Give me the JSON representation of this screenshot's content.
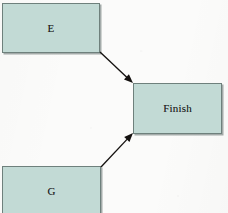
{
  "diagram": {
    "type": "flowchart",
    "title": "",
    "canvas": {
      "width": 228,
      "height": 213,
      "background": "#fbfbfa"
    },
    "style": {
      "node_fill": "#c2dad5",
      "node_border": "#6e807c",
      "node_shadow": "#5c6a67",
      "edge_color": "#14110f",
      "label_color": "#1d1d1d"
    },
    "nodes": [
      {
        "id": "E",
        "label": "E",
        "shape": "rectangle",
        "x": 2,
        "y": 3,
        "width": 98,
        "height": 50,
        "cropped": false
      },
      {
        "id": "Finish",
        "label": "Finish",
        "shape": "rectangle",
        "x": 133,
        "y": 83,
        "width": 89,
        "height": 51,
        "cropped": false
      },
      {
        "id": "G",
        "label": "G",
        "shape": "rectangle",
        "x": 2,
        "y": 166,
        "width": 99,
        "height": 56,
        "cropped": true
      }
    ],
    "edges": [
      {
        "id": "edge-e-finish",
        "from": "E",
        "to": "Finish",
        "label": "",
        "arrowhead": "filled-triangle",
        "from_point": [
          100,
          52
        ],
        "to_point": [
          133,
          83
        ]
      },
      {
        "id": "edge-g-finish",
        "from": "G",
        "to": "Finish",
        "label": "",
        "arrowhead": "filled-triangle",
        "from_point": [
          101,
          167
        ],
        "to_point": [
          133,
          133
        ]
      }
    ]
  }
}
